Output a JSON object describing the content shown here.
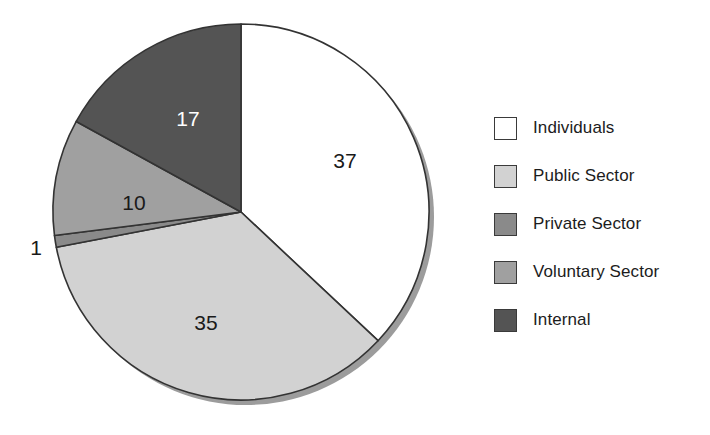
{
  "chart_data": {
    "type": "pie",
    "title": "",
    "labels": [
      "Individuals",
      "Public Sector",
      "Private Sector",
      "Voluntary Sector",
      "Internal"
    ],
    "values": [
      37,
      35,
      1,
      10,
      17
    ],
    "value_labels": [
      "37",
      "35",
      "1",
      "10",
      "17"
    ],
    "colors": [
      "#ffffff",
      "#d2d2d2",
      "#8a8a8a",
      "#a0a0a0",
      "#545454"
    ],
    "label_text_colors": [
      "#1a1a1a",
      "#1a1a1a",
      "#1a1a1a",
      "#1a1a1a",
      "#ffffff"
    ],
    "total": 100,
    "start_angle_deg": 0,
    "direction": "clockwise",
    "legend_position": "right",
    "grid": false,
    "xlabel": "",
    "ylabel": ""
  },
  "pie": {
    "center_x": 241,
    "center_y": 212,
    "radius": 188,
    "outline_color": "#333333",
    "shadow_color": "#9c9c9c",
    "slices": [
      {
        "name": "Individuals",
        "value_label": "37",
        "label_x": 345,
        "label_y": 168,
        "text_color": "#1a1a1a"
      },
      {
        "name": "Public Sector",
        "value_label": "35",
        "label_x": 206,
        "label_y": 330,
        "text_color": "#1a1a1a"
      },
      {
        "name": "Private Sector",
        "value_label": "1",
        "label_x": 36,
        "label_y": 255,
        "text_color": "#1a1a1a"
      },
      {
        "name": "Voluntary Sector",
        "value_label": "10",
        "label_x": 134,
        "label_y": 210,
        "text_color": "#1a1a1a"
      },
      {
        "name": "Internal",
        "value_label": "17",
        "label_x": 188,
        "label_y": 126,
        "text_color": "#ffffff"
      }
    ]
  },
  "legend": {
    "items": [
      {
        "label": "Individuals",
        "color": "#ffffff"
      },
      {
        "label": "Public Sector",
        "color": "#d2d2d2"
      },
      {
        "label": "Private Sector",
        "color": "#8a8a8a"
      },
      {
        "label": "Voluntary Sector",
        "color": "#a0a0a0"
      },
      {
        "label": "Internal",
        "color": "#545454"
      }
    ]
  }
}
